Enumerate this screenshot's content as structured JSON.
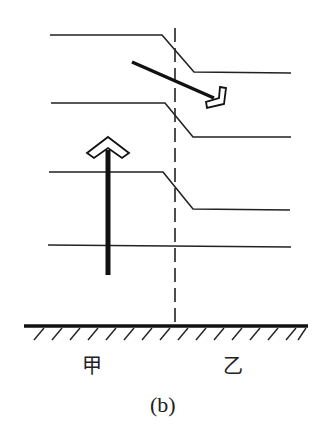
{
  "diagram": {
    "labels": {
      "left_region": "甲",
      "right_region": "乙",
      "caption": "(b)"
    },
    "isolines": [
      {
        "left_y": 35,
        "right_y": 73
      },
      {
        "left_y": 103,
        "right_y": 137
      },
      {
        "left_y": 172,
        "right_y": 209
      },
      {
        "left_y": 246,
        "right_y": 246
      }
    ],
    "arrows": [
      {
        "name": "upward-airflow",
        "direction": "up",
        "style": "hollow-head"
      },
      {
        "name": "horizontal-airflow",
        "direction": "down-right",
        "style": "hollow-head"
      }
    ],
    "colors": {
      "line": "#222222",
      "background": "#ffffff"
    }
  }
}
